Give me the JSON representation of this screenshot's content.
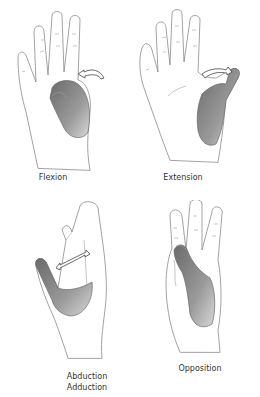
{
  "figure": {
    "panels": [
      {
        "id": "flexion",
        "caption": "Flexion"
      },
      {
        "id": "extension",
        "caption": "Extension"
      },
      {
        "id": "abduction-adduction",
        "caption_line1": "Abduction",
        "caption_line2": "Adduction"
      },
      {
        "id": "opposition",
        "caption": "Opposition"
      }
    ],
    "colors": {
      "line": "#8a8a8a",
      "shade_dark": "#5a5a5a",
      "shade_light": "#cfcfcf",
      "background": "#ffffff"
    }
  }
}
